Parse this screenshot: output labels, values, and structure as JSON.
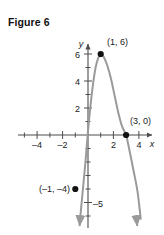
{
  "figure": {
    "title": "Figure 6"
  },
  "chart_data": {
    "type": "line",
    "title": "Figure 6",
    "subtitle": "",
    "xlabel": "x",
    "ylabel": "y",
    "xlim": [
      -5.5,
      5.5
    ],
    "ylim": [
      -6.5,
      7.2
    ],
    "grid": false,
    "legend": null,
    "curve_description": "downward-opening parabola with vertex at (1, 6)",
    "curves": [
      {
        "name": "parabola",
        "color": "#9a9a9a",
        "arrow_start": true,
        "arrow_end": true,
        "points": [
          [
            -0.62,
            -6.2
          ],
          [
            -0.4,
            -4.0
          ],
          [
            -0.2,
            -2.0
          ],
          [
            0.0,
            0.3
          ],
          [
            0.2,
            2.2
          ],
          [
            0.4,
            3.8
          ],
          [
            0.6,
            5.0
          ],
          [
            0.8,
            5.7
          ],
          [
            1.0,
            6.0
          ],
          [
            1.2,
            5.85
          ],
          [
            1.5,
            5.2
          ],
          [
            1.8,
            4.2
          ],
          [
            2.1,
            2.9
          ],
          [
            2.4,
            1.6
          ],
          [
            2.7,
            0.6
          ],
          [
            3.0,
            0.0
          ],
          [
            3.3,
            -1.3
          ],
          [
            3.6,
            -2.7
          ],
          [
            3.9,
            -4.2
          ],
          [
            4.15,
            -6.2
          ]
        ]
      }
    ],
    "points": [
      {
        "label": "(1, 6)",
        "x": 1,
        "y": 6,
        "label_dx": 0.45,
        "label_dy": 1.0
      },
      {
        "label": "(3, 0)",
        "x": 3,
        "y": 0,
        "label_dx": 0.35,
        "label_dy": 1.15
      },
      {
        "label": "(–1, –4)",
        "x": -1,
        "y": -4,
        "label_dx": -0.45,
        "label_dy": 0.12
      }
    ],
    "x_ticks": [
      -4,
      -2,
      2,
      4
    ],
    "x_tick_labels": [
      "–4",
      "–2",
      "2",
      "4"
    ],
    "x_minor_ticks": [
      -5,
      -3,
      -1,
      1,
      3,
      5
    ],
    "y_ticks": [
      2,
      4,
      6,
      -5
    ],
    "y_tick_labels": [
      "2",
      "4",
      "6",
      "–5"
    ],
    "y_minor_ticks": [
      1,
      3,
      5,
      7,
      -1,
      -2,
      -3,
      -4,
      -6
    ],
    "axis_color": "#4d4d4d",
    "curve_color": "#9a9a9a",
    "point_color": "#111111",
    "text_color": "#1a1a1a"
  }
}
